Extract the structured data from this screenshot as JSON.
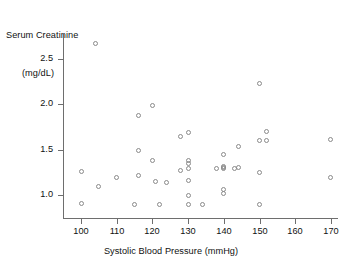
{
  "chart_data": {
    "type": "scatter",
    "title": "",
    "xlabel": "Systolic Blood Pressure (mmHg)",
    "ylabel": "Serum Creatinine (mg/dL)",
    "ylabel_line1": "Serum Creatinine",
    "ylabel_line2": "(mg/dL)",
    "xlim": [
      96,
      174
    ],
    "ylim": [
      0.82,
      2.78
    ],
    "xticks": [
      100,
      110,
      120,
      130,
      140,
      150,
      160,
      170
    ],
    "xtick_labels": [
      "100",
      "110",
      "120",
      "130",
      "140",
      "150",
      "160",
      "170"
    ],
    "yticks": [
      1.0,
      1.5,
      2.0,
      2.5
    ],
    "ytick_labels": [
      "1.0",
      "1.5",
      "2.0",
      "2.5"
    ],
    "grid": false,
    "legend": false,
    "marker": "open-circle",
    "marker_color": "#8a8a8a",
    "axis_color": "#6e6e6e",
    "x": [
      104,
      100,
      100,
      105,
      110,
      115,
      116,
      116,
      116,
      116,
      120,
      120,
      121,
      124,
      128,
      128,
      128,
      130,
      130,
      130,
      130,
      130,
      130,
      130,
      134,
      138,
      140,
      140,
      140,
      140,
      140,
      140,
      144,
      144,
      144,
      150,
      150,
      150,
      150,
      150,
      152,
      152,
      170,
      170
    ],
    "y": [
      2.67,
      1.26,
      0.91,
      1.09,
      1.19,
      0.9,
      1.88,
      1.49,
      1.22,
      0.9,
      1.99,
      1.38,
      1.15,
      1.14,
      1.65,
      1.27,
      0.9,
      1.69,
      1.38,
      1.35,
      1.29,
      1.16,
      1.0,
      0.9,
      0.9,
      1.29,
      1.45,
      1.31,
      1.3,
      1.29,
      1.06,
      1.02,
      1.53,
      1.3,
      0.9,
      2.23,
      1.6,
      1.29,
      1.25,
      0.9,
      1.7,
      1.6,
      1.61,
      1.19
    ],
    "points": [
      {
        "x": 104,
        "y": 2.67
      },
      {
        "x": 100,
        "y": 1.26
      },
      {
        "x": 100,
        "y": 0.91
      },
      {
        "x": 105,
        "y": 1.09
      },
      {
        "x": 110,
        "y": 1.19
      },
      {
        "x": 115,
        "y": 0.9
      },
      {
        "x": 116,
        "y": 1.88
      },
      {
        "x": 116,
        "y": 1.49
      },
      {
        "x": 116,
        "y": 1.22
      },
      {
        "x": 120,
        "y": 1.99
      },
      {
        "x": 120,
        "y": 1.38
      },
      {
        "x": 121,
        "y": 1.15
      },
      {
        "x": 124,
        "y": 1.14
      },
      {
        "x": 128,
        "y": 1.65
      },
      {
        "x": 128,
        "y": 1.27
      },
      {
        "x": 122,
        "y": 0.9
      },
      {
        "x": 130,
        "y": 1.69
      },
      {
        "x": 130,
        "y": 1.38
      },
      {
        "x": 130,
        "y": 1.35
      },
      {
        "x": 130,
        "y": 1.29
      },
      {
        "x": 130,
        "y": 1.16
      },
      {
        "x": 130,
        "y": 1.0
      },
      {
        "x": 130,
        "y": 0.9
      },
      {
        "x": 134,
        "y": 0.9
      },
      {
        "x": 138,
        "y": 1.29
      },
      {
        "x": 140,
        "y": 1.45
      },
      {
        "x": 140,
        "y": 1.31
      },
      {
        "x": 140,
        "y": 1.3
      },
      {
        "x": 140,
        "y": 1.29
      },
      {
        "x": 140,
        "y": 1.06
      },
      {
        "x": 140,
        "y": 1.02
      },
      {
        "x": 144,
        "y": 1.53
      },
      {
        "x": 144,
        "y": 1.3
      },
      {
        "x": 143,
        "y": 1.29
      },
      {
        "x": 150,
        "y": 2.23
      },
      {
        "x": 150,
        "y": 1.6
      },
      {
        "x": 150,
        "y": 1.25
      },
      {
        "x": 150,
        "y": 0.9
      },
      {
        "x": 152,
        "y": 1.7
      },
      {
        "x": 152,
        "y": 1.6
      },
      {
        "x": 170,
        "y": 1.61
      },
      {
        "x": 170,
        "y": 1.19
      }
    ]
  },
  "layout": {
    "plot_left_px": 63,
    "plot_bottom_px": 218,
    "x_origin_px": 81,
    "x_scale_px_per_unit": 3.5714,
    "y_origin_px": 195,
    "y_scale_px_per_unit": 90.667
  }
}
